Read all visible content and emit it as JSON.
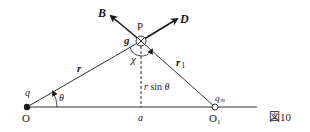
{
  "figure": {
    "caption": "図10",
    "points": {
      "origin": {
        "label": "O",
        "charge_label": "q"
      },
      "p": {
        "label": "P"
      },
      "o1": {
        "label": "O",
        "sub": "1",
        "charge_label": "q",
        "charge_sub": "m"
      },
      "foot": {
        "label": "a"
      }
    },
    "vectors": {
      "b": "B",
      "d": "D"
    },
    "labels": {
      "g": "g",
      "chi": "χ",
      "r": "r",
      "r1_main": "r",
      "r1_sub": "1",
      "rsin_r": "r",
      "rsin_fn": " sin ",
      "rsin_theta": "θ",
      "theta": "θ"
    },
    "colors": {
      "ink": "#1a1a1a",
      "background": "#ffffff"
    }
  }
}
